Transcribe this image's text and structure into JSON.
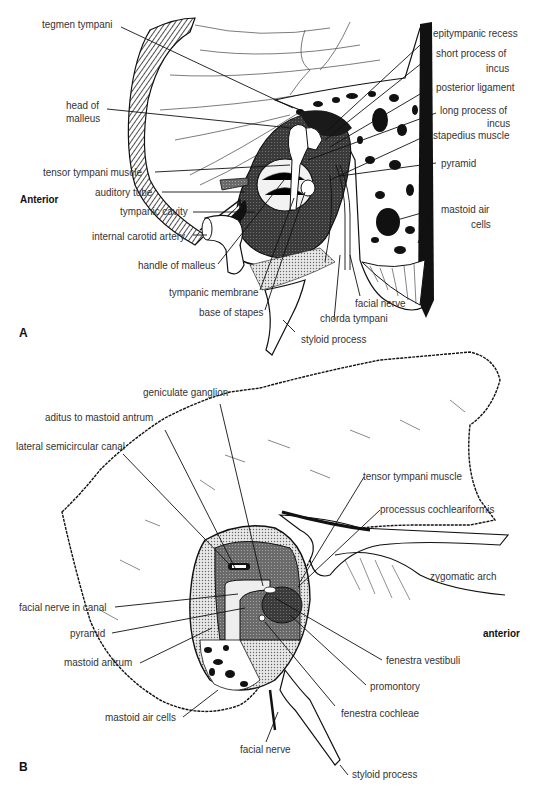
{
  "figure": {
    "panel_a": {
      "letter": "A",
      "orientation": "Anterior",
      "labels": {
        "tegmen_tympani": "tegmen tympani",
        "head_of_malleus": "head of\nmalleus",
        "head_of_malleus_1": "head of",
        "head_of_malleus_2": "malleus",
        "tensor_tympani_muscle": "tensor tympani muscle",
        "auditory_tube": "auditory tube",
        "tympanic_cavity": "tympanic cavity",
        "internal_carotid_artery": "internal carotid artery",
        "handle_of_malleus": "handle of malleus",
        "tympanic_membrane": "tympanic membrane",
        "base_of_stapes": "base of stapes",
        "styloid_process": "styloid process",
        "chorda_tympani": "chorda tympani",
        "facial_nerve": "facial nerve",
        "mastoid_air_cells_1": "mastoid air",
        "mastoid_air_cells_2": "cells",
        "epitympanic_recess": "epitympanic recess",
        "short_process_of_incus_1": "short process of",
        "short_process_of_incus_2": "incus",
        "posterior_ligament": "posterior ligament",
        "long_process_of_incus_1": "long process of",
        "long_process_of_incus_2": "incus",
        "stapedius_muscle": "stapedius muscle",
        "pyramid": "pyramid"
      }
    },
    "panel_b": {
      "letter": "B",
      "orientation": "anterior",
      "labels": {
        "geniculate_ganglion": "geniculate ganglion",
        "aditus_to_mastoid_antrum": "aditus to mastoid antrum",
        "lateral_semicircular_canal": "lateral semicircular canal",
        "tensor_tympani_muscle": "tensor tympani muscle",
        "processus_cochleariformis": "processus cochleariformis",
        "zygomatic_arch": "zygomatic arch",
        "facial_nerve_in_canal": "facial nerve in canal",
        "pyramid": "pyramid",
        "mastoid_antrum": "mastoid antrum",
        "mastoid_air_cells": "mastoid air cells",
        "facial_nerve": "facial nerve",
        "fenestra_vestibuli": "fenestra vestibuli",
        "promontory": "promontory",
        "fenestra_cochleae": "fenestra cochleae",
        "styloid_process": "styloid process"
      }
    }
  }
}
